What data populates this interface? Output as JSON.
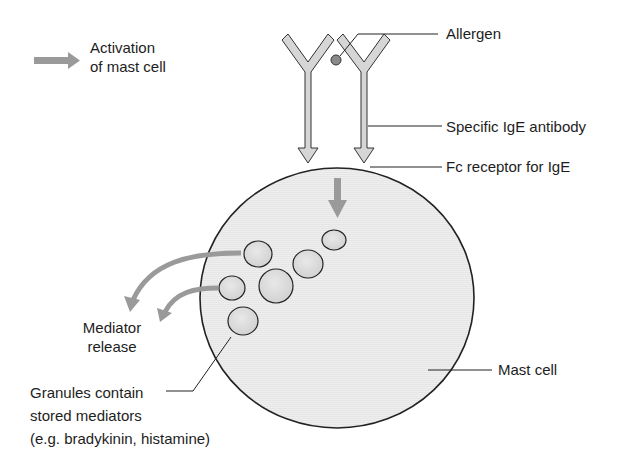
{
  "legend": {
    "arrow_icon": "gray-right-arrow",
    "line1": "Activation",
    "line2": "of mast cell"
  },
  "labels": {
    "allergen": "Allergen",
    "ige_antibody": "Specific IgE antibody",
    "fc_receptor": "Fc receptor for IgE",
    "mediator_release_1": "Mediator",
    "mediator_release_2": "release",
    "granules_1": "Granules contain",
    "granules_2": "stored mediators",
    "granules_3": "(e.g. bradykinin, histamine)",
    "mast_cell": "Mast cell"
  },
  "colors": {
    "arrow_gray": "#9a9a9a",
    "cell_fill": "#ececec",
    "granule_fill": "#dedede",
    "allergen_fill": "#8a8a8a",
    "outline": "#222222"
  }
}
